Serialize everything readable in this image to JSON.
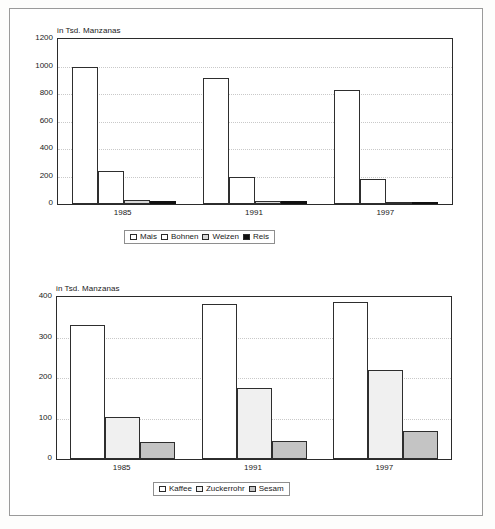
{
  "page": {
    "background_color": "#ffffff",
    "frame_color": "#9a9a9a"
  },
  "charts": [
    {
      "id": "crops-basic-grains",
      "axis_title": "in Tsd. Manzanas",
      "legend": [
        {
          "label": "Mais",
          "color": "#ffffff"
        },
        {
          "label": "Bohnen",
          "color": "#ffffff"
        },
        {
          "label": "Weizen",
          "color": "#d9d9d9"
        },
        {
          "label": "Reis",
          "color": "#101010"
        }
      ]
    },
    {
      "id": "crops-export",
      "axis_title": "in Tsd. Manzanas",
      "legend": [
        {
          "label": "Kaffee",
          "color": "#ffffff"
        },
        {
          "label": "Zuckerrohr",
          "color": "#f0f0f0"
        },
        {
          "label": "Sesam",
          "color": "#c4c4c4"
        }
      ]
    }
  ],
  "chart_data": [
    {
      "type": "bar",
      "id": "crops-basic-grains",
      "title": "",
      "xlabel": "",
      "ylabel": "in Tsd. Manzanas",
      "ylim": [
        0,
        1200
      ],
      "yticks": [
        0,
        200,
        400,
        600,
        800,
        1000,
        1200
      ],
      "ytick_labels": [
        "0",
        "200",
        "400",
        "600",
        "800",
        "1000",
        "1200"
      ],
      "categories": [
        "1985",
        "1991",
        "1997"
      ],
      "grid": true,
      "legend_position": "below",
      "series": [
        {
          "name": "Mais",
          "color": "#ffffff",
          "values": [
            995,
            915,
            830
          ]
        },
        {
          "name": "Bohnen",
          "color": "#ffffff",
          "values": [
            243,
            193,
            180
          ]
        },
        {
          "name": "Weizen",
          "color": "#d9d9d9",
          "values": [
            30,
            20,
            14
          ]
        },
        {
          "name": "Reis",
          "color": "#101010",
          "values": [
            22,
            24,
            18
          ]
        }
      ]
    },
    {
      "type": "bar",
      "id": "crops-export",
      "title": "",
      "xlabel": "",
      "ylabel": "in Tsd. Manzanas",
      "ylim": [
        0,
        400
      ],
      "yticks": [
        0,
        100,
        200,
        300,
        400
      ],
      "ytick_labels": [
        "0",
        "100",
        "200",
        "300",
        "400"
      ],
      "categories": [
        "1985",
        "1991",
        "1997"
      ],
      "grid": true,
      "legend_position": "below",
      "series": [
        {
          "name": "Kaffee",
          "color": "#ffffff",
          "values": [
            331,
            383,
            387
          ]
        },
        {
          "name": "Zuckerrohr",
          "color": "#f0f0f0",
          "values": [
            103,
            175,
            219
          ]
        },
        {
          "name": "Sesam",
          "color": "#c4c4c4",
          "values": [
            42,
            44,
            68
          ]
        }
      ]
    }
  ]
}
